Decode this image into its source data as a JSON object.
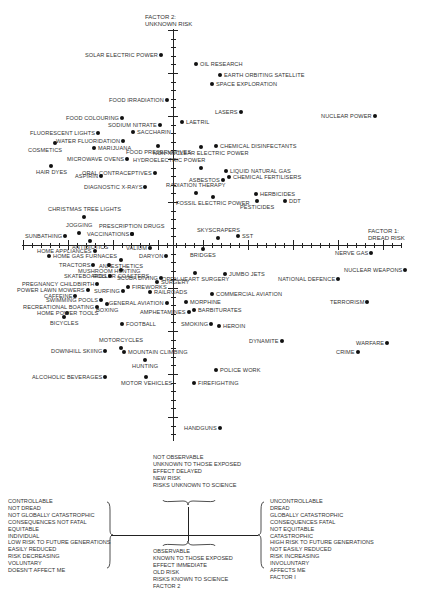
{
  "chart_data": {
    "type": "scatter",
    "title": "",
    "xlabel": "FACTOR 1: DREAD RISK",
    "ylabel": "FACTOR 2: UNKNOWN RISK",
    "grid": false,
    "legend_position": "bottom",
    "axes": {
      "x_title_line1": "FACTOR 1:",
      "x_title_line2": "DREAD RISK",
      "y_title_line1": "FACTOR 2:",
      "y_title_line2": "UNKNOWN RISK"
    },
    "points": [
      {
        "label": "SOLAR ELECTRIC POWER",
        "x": 161,
        "y": 55,
        "side": "left"
      },
      {
        "label": "OIL RESEARCH",
        "x": 196,
        "y": 64,
        "side": "right"
      },
      {
        "label": "EARTH ORBITING SATELLITE",
        "x": 220,
        "y": 75,
        "side": "right"
      },
      {
        "label": "SPACE EXPLORATION",
        "x": 212,
        "y": 84,
        "side": "right"
      },
      {
        "label": "FOOD IRRADIATION",
        "x": 167,
        "y": 100,
        "side": "left"
      },
      {
        "label": "LASERS",
        "x": 241,
        "y": 112,
        "side": "left"
      },
      {
        "label": "NUCLEAR POWER",
        "x": 375,
        "y": 116,
        "side": "left"
      },
      {
        "label": "LAETRIL",
        "x": 182,
        "y": 122,
        "side": "right"
      },
      {
        "label": "FOOD COLOURING",
        "x": 122,
        "y": 118,
        "side": "left"
      },
      {
        "label": "SODIUM NITRATE",
        "x": 160,
        "y": 125,
        "side": "left"
      },
      {
        "label": "SACCHARIN",
        "x": 133,
        "y": 132,
        "side": "right"
      },
      {
        "label": "FLUORESCENT LIGHTS",
        "x": 98,
        "y": 133,
        "side": "left"
      },
      {
        "label": "WATER FLUORIDATION",
        "x": 123,
        "y": 141,
        "side": "left"
      },
      {
        "label": "FOOD PRESERVATIVES",
        "x": 158,
        "y": 146,
        "side": "below"
      },
      {
        "label": "CHEMICAL DISINFECTANTS",
        "x": 216,
        "y": 146,
        "side": "right"
      },
      {
        "label": "NON-NUCLEAR ELECTRIC POWER",
        "x": 201,
        "y": 147,
        "side": "below"
      },
      {
        "label": "COSMETICS",
        "x": 55,
        "y": 143,
        "side": "below-left"
      },
      {
        "label": "MARIJUANA",
        "x": 94,
        "y": 148,
        "side": "right"
      },
      {
        "label": "MICROWAVE OVENS",
        "x": 127,
        "y": 159,
        "side": "left"
      },
      {
        "label": "HYDROELECTRIC POWER",
        "x": 201,
        "y": 168,
        "side": "above-left"
      },
      {
        "label": "LIQUID NATURAL GAS",
        "x": 226,
        "y": 171,
        "side": "right"
      },
      {
        "label": "CHEMICAL FERTILISERS",
        "x": 229,
        "y": 177,
        "side": "right"
      },
      {
        "label": "HAIR DYES",
        "x": 51,
        "y": 166,
        "side": "below"
      },
      {
        "label": "ORAL CONTRACEPTIVES",
        "x": 155,
        "y": 173,
        "side": "left"
      },
      {
        "label": "ASPIRIN",
        "x": 101,
        "y": 176,
        "side": "left"
      },
      {
        "label": "ASBESTOS",
        "x": 223,
        "y": 180,
        "side": "left"
      },
      {
        "label": "DIAGNOSTIC X-RAYS",
        "x": 145,
        "y": 187,
        "side": "left"
      },
      {
        "label": "RADIATION THERAPY",
        "x": 196,
        "y": 193,
        "side": "above"
      },
      {
        "label": "HERBICIDES",
        "x": 256,
        "y": 194,
        "side": "right"
      },
      {
        "label": "FOSSIL ELECTRIC POWER",
        "x": 213,
        "y": 197,
        "side": "below"
      },
      {
        "label": "DDT",
        "x": 285,
        "y": 201,
        "side": "right"
      },
      {
        "label": "PESTICIDES",
        "x": 257,
        "y": 201,
        "side": "below"
      },
      {
        "label": "CHRISTMAS TREE LIGHTS",
        "x": 84,
        "y": 217,
        "side": "above"
      },
      {
        "label": "JOGGING",
        "x": 79,
        "y": 233,
        "side": "above"
      },
      {
        "label": "PRESCRIPTION DRUGS",
        "x": 132,
        "y": 234,
        "side": "above"
      },
      {
        "label": "SUNBATHING",
        "x": 65,
        "y": 236,
        "side": "left"
      },
      {
        "label": "VACCINATIONS",
        "x": 132,
        "y": 234,
        "side": "left"
      },
      {
        "label": "SKYSCRAPERS",
        "x": 218,
        "y": 238,
        "side": "above"
      },
      {
        "label": "SST",
        "x": 238,
        "y": 236,
        "side": "right"
      },
      {
        "label": "ANTIBIOTICS",
        "x": 90,
        "y": 241,
        "side": "below"
      },
      {
        "label": "VALIUM",
        "x": 150,
        "y": 248,
        "side": "left"
      },
      {
        "label": "HOME APPLIANCES",
        "x": 95,
        "y": 251,
        "side": "left"
      },
      {
        "label": "BRIDGES",
        "x": 203,
        "y": 249,
        "side": "below"
      },
      {
        "label": "NERVE GAS",
        "x": 371,
        "y": 253,
        "side": "left"
      },
      {
        "label": "HOME GAS FURNACES",
        "x": 49,
        "y": 256,
        "side": "right"
      },
      {
        "label": "DARYON",
        "x": 166,
        "y": 256,
        "side": "left"
      },
      {
        "label": "ANAESTHETICS",
        "x": 121,
        "y": 260,
        "side": "below"
      },
      {
        "label": "TRACTORS",
        "x": 93,
        "y": 265,
        "side": "left"
      },
      {
        "label": "MUSHROOM HUNTING",
        "x": 109,
        "y": 265,
        "side": "below"
      },
      {
        "label": "ROLLER COASTERS",
        "x": 121,
        "y": 270,
        "side": "below"
      },
      {
        "label": "NUCLEAR WEAPONS",
        "x": 405,
        "y": 270,
        "side": "left"
      },
      {
        "label": "JUMBO JETS",
        "x": 225,
        "y": 274,
        "side": "right"
      },
      {
        "label": "SKATEBOARDS",
        "x": 110,
        "y": 276,
        "side": "left"
      },
      {
        "label": "SCUBA DIVING",
        "x": 161,
        "y": 278,
        "side": "left"
      },
      {
        "label": "NATIONAL DEFENCE",
        "x": 338,
        "y": 279,
        "side": "left"
      },
      {
        "label": "OPEN-HEART SURGERY",
        "x": 195,
        "y": 273,
        "side": "below"
      },
      {
        "label": "SURGERY",
        "x": 157,
        "y": 282,
        "side": "right"
      },
      {
        "label": "PREGNANCY CHILDBIRTH",
        "x": 97,
        "y": 284,
        "side": "left"
      },
      {
        "label": "FIREWORKS",
        "x": 128,
        "y": 287,
        "side": "right"
      },
      {
        "label": "POWER LAWN MOWERS",
        "x": 88,
        "y": 290,
        "side": "left"
      },
      {
        "label": "SURFING",
        "x": 123,
        "y": 291,
        "side": "left"
      },
      {
        "label": "CAFFEINE",
        "x": 75,
        "y": 296,
        "side": "left"
      },
      {
        "label": "RAILROADS",
        "x": 150,
        "y": 292,
        "side": "right"
      },
      {
        "label": "COMMERCIAL AVIATION",
        "x": 212,
        "y": 294,
        "side": "right"
      },
      {
        "label": "SWIMMING POOLS",
        "x": 101,
        "y": 300,
        "side": "left"
      },
      {
        "label": "GENERAL AVIATION",
        "x": 167,
        "y": 303,
        "side": "left"
      },
      {
        "label": "MORPHINE",
        "x": 186,
        "y": 302,
        "side": "right"
      },
      {
        "label": "TERRORISM",
        "x": 367,
        "y": 302,
        "side": "left"
      },
      {
        "label": "RECREATIONAL BOATING",
        "x": 97,
        "y": 307,
        "side": "left"
      },
      {
        "label": "BOXING",
        "x": 107,
        "y": 304,
        "side": "below"
      },
      {
        "label": "AMPHETAMINES",
        "x": 189,
        "y": 312,
        "side": "left"
      },
      {
        "label": "BARBITURATES",
        "x": 194,
        "y": 310,
        "side": "right"
      },
      {
        "label": "HOME POWER TOOLS",
        "x": 67,
        "y": 313,
        "side": "center"
      },
      {
        "label": "BICYCLES",
        "x": 64,
        "y": 317,
        "side": "below"
      },
      {
        "label": "FOOTBALL",
        "x": 122,
        "y": 324,
        "side": "right"
      },
      {
        "label": "SMOKING",
        "x": 211,
        "y": 324,
        "side": "left"
      },
      {
        "label": "HEROIN",
        "x": 219,
        "y": 326,
        "side": "right"
      },
      {
        "label": "DYNAMITE",
        "x": 282,
        "y": 341,
        "side": "left"
      },
      {
        "label": "WARFARE",
        "x": 387,
        "y": 343,
        "side": "left"
      },
      {
        "label": "CRIME",
        "x": 358,
        "y": 352,
        "side": "left"
      },
      {
        "label": "MOTORCYCLES",
        "x": 121,
        "y": 348,
        "side": "above"
      },
      {
        "label": "DOWNHILL SKIING",
        "x": 105,
        "y": 351,
        "side": "left"
      },
      {
        "label": "MOUNTAIN CLIMBING",
        "x": 124,
        "y": 352,
        "side": "right"
      },
      {
        "label": "HUNTING",
        "x": 145,
        "y": 360,
        "side": "below"
      },
      {
        "label": "POLICE WORK",
        "x": 216,
        "y": 370,
        "side": "right"
      },
      {
        "label": "ALCOHOLIC BEVERAGES",
        "x": 105,
        "y": 377,
        "side": "left"
      },
      {
        "label": "MOTOR VEHICLES",
        "x": 146,
        "y": 377,
        "side": "below"
      },
      {
        "label": "FIREFIGHTING",
        "x": 194,
        "y": 383,
        "side": "right"
      },
      {
        "label": "HANDGUNS",
        "x": 220,
        "y": 428,
        "side": "left"
      }
    ]
  },
  "legend": {
    "left_block": [
      "CONTROLLABLE",
      "NOT DREAD",
      "NOT GLOBALLY CATASTROPHIC",
      "CONSEQUENCES NOT FATAL",
      "EQUITABLE",
      "INDIVIDUAL",
      "LOW RISK TO FUTURE GENERATIONS",
      "EASILY REDUCED",
      "RISK DECREASING",
      "VOLUNTARY",
      "DOESN'T AFFECT ME"
    ],
    "top_block": [
      "NOT OBSERVABLE",
      "UNKNOWN TO THOSE EXPOSED",
      "EFFECT DELAYED",
      "NEW RISK",
      "RISKS UNKNOWN TO SCIENCE"
    ],
    "bottom_block": [
      "OBSERVABLE",
      "KNOWN TO THOSE EXPOSED",
      "EFFECT IMMEDIATE",
      "OLD RISK",
      "RISKS KNOWN TO SCIENCE",
      "FACTOR 2"
    ],
    "right_block": [
      "UNCONTROLLABLE",
      "DREAD",
      "GLOBALLY CATASTROPHIC",
      "CONSEQUENCES FATAL",
      "NOT EQUITABLE",
      "CATASTROPHIC",
      "HIGH RISK TO FUTURE GENERATIONS",
      "NOT EASILY REDUCED",
      "RISK INCREASING",
      "INVOLUNTARY",
      "AFFECTS ME",
      "FACTOR I"
    ]
  }
}
